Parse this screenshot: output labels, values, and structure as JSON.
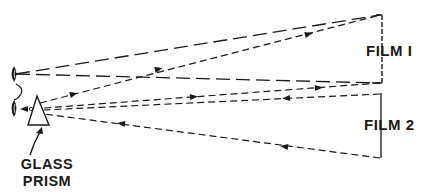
{
  "diagram": {
    "labels": {
      "film1": "FILM I",
      "film2": "FILM 2",
      "prism_line1": "GLASS",
      "prism_line2": "PRISM"
    },
    "elements": [
      {
        "id": "upper-eye",
        "shape": "eye"
      },
      {
        "id": "lower-eye",
        "shape": "eye"
      },
      {
        "id": "glass-prism",
        "shape": "triangle"
      },
      {
        "id": "film-1",
        "shape": "vertical-line",
        "style": "dashed"
      },
      {
        "id": "film-2",
        "shape": "vertical-line",
        "style": "solid"
      }
    ],
    "rays": [
      {
        "from": "upper-eye",
        "to": "film-1-top",
        "style": "long-dash"
      },
      {
        "from": "upper-eye",
        "to": "film-1-bottom",
        "style": "long-dash"
      },
      {
        "from": "glass-prism",
        "to": "film-1-top",
        "style": "short-dash",
        "arrow": "toward-film"
      },
      {
        "from": "glass-prism",
        "to": "film-1-bottom",
        "style": "short-dash",
        "arrow": "toward-film"
      },
      {
        "from": "film-2-top",
        "to": "glass-prism",
        "style": "short-dash",
        "arrow": "toward-prism"
      },
      {
        "from": "film-2-bottom",
        "to": "glass-prism",
        "style": "short-dash",
        "arrow": "toward-prism"
      }
    ],
    "colors": {
      "ink": "#1a1a1a",
      "background": "#ffffff"
    }
  }
}
